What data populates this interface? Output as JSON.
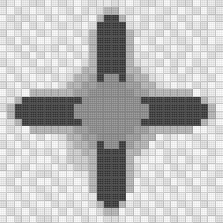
{
  "canvas": {
    "width": 223,
    "height": 223,
    "title": "pixel-star-mosaic"
  },
  "grid": {
    "columns": 30,
    "rows": 30,
    "cell_size_px": 7.43,
    "gridline_color": "#787878",
    "description": "30 by 30 quilt mosaic of an eight pointed star"
  },
  "palette": {
    "0": "#fbfbfb",
    "1": "#ededed",
    "2": "#e0e0e0",
    "3": "#cfcfcf",
    "4": "#b4b4b4",
    "5": "#9b9b9b",
    "6": "#8a8a8a",
    "7": "#6e6e6e",
    "8": "#4a4a4a",
    "9": "#363636"
  },
  "legend": [
    {
      "key": "0",
      "label": "white",
      "color": "#fbfbfb"
    },
    {
      "key": "1",
      "label": "off-white",
      "color": "#ededed"
    },
    {
      "key": "2",
      "label": "pale-grey",
      "color": "#e0e0e0"
    },
    {
      "key": "3",
      "label": "light-grey",
      "color": "#cfcfcf"
    },
    {
      "key": "4",
      "label": "silver",
      "color": "#b4b4b4"
    },
    {
      "key": "5",
      "label": "medium-grey",
      "color": "#9b9b9b"
    },
    {
      "key": "6",
      "label": "star-centre-grey",
      "color": "#8a8a8a"
    },
    {
      "key": "7",
      "label": "dark-grey",
      "color": "#6e6e6e"
    },
    {
      "key": "8",
      "label": "charcoal",
      "color": "#4a4a4a"
    },
    {
      "key": "9",
      "label": "near-black",
      "color": "#363636"
    }
  ],
  "pixels": [
    "210122012101211210122101220112",
    "102101101202121012110121012021",
    "021210210121011201021210210112",
    "112021012110212102120121021201",
    "201102101021120210211202102110",
    "120210012102191021012011210201",
    "012021120210991202101210120112",
    "101202011021099920121021201021",
    "210120102102099901211202102110",
    "021012210120999901021012021201",
    "102101021201999955102101210120",
    "210210102199999556210210102101",
    "021021210999955566021021210210",
    "110112021999555666110112021021",
    "201201102955556666601201102110",
    "012012210555666666010120210201",
    "120120021556666665101202101120",
    "021021120566666655010210120012",
    "102102012566666551021021012101",
    "210210101666665510210210101210",
    "021021210666551021021021210021",
    "110110021665510110110021021110",
    "201201102155101201201102110201",
    "012012210011012012210201201012",
    "120120021101120120021120120120",
    "012012102010012102012012012012",
    "101101210101101210101101101101",
    "210210021210210021210210210210",
    "021021102021021102021021021021",
    "102102210102102210102102102102"
  ],
  "pattern_regions": [
    {
      "name": "north-star-point",
      "tone": "near-black",
      "color": "#363636"
    },
    {
      "name": "east-star-point",
      "tone": "near-black",
      "color": "#363636"
    },
    {
      "name": "south-star-point",
      "tone": "near-black",
      "color": "#363636"
    },
    {
      "name": "west-star-point",
      "tone": "near-black",
      "color": "#363636"
    },
    {
      "name": "northeast-star-point",
      "tone": "medium-grey",
      "color": "#9b9b9b"
    },
    {
      "name": "southeast-star-point",
      "tone": "medium-grey",
      "color": "#9b9b9b"
    },
    {
      "name": "southwest-star-point",
      "tone": "medium-grey",
      "color": "#9b9b9b"
    },
    {
      "name": "northwest-star-point",
      "tone": "medium-grey",
      "color": "#9b9b9b"
    },
    {
      "name": "star-centre",
      "tone": "star-centre-grey",
      "color": "#8a8a8a"
    },
    {
      "name": "background-field",
      "tone": "white-and-pale-grey",
      "color": "#ededed"
    }
  ]
}
